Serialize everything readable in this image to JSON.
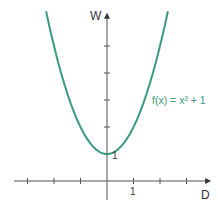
{
  "chart_data": {
    "type": "line",
    "title": "",
    "xlabel": "D",
    "ylabel": "W",
    "annotation": "f(x) = x² + 1",
    "vertex_label": "1",
    "x_tick_label": "1",
    "xlim": [
      -4,
      4
    ],
    "ylim": [
      -1,
      6.5
    ],
    "x_ticks": [
      -3,
      -2,
      -1,
      1,
      2,
      3
    ],
    "y_ticks": [
      1,
      2,
      3,
      4,
      5
    ],
    "grid": false,
    "series": [
      {
        "name": "f(x) = x² + 1",
        "color": "#3a9a80",
        "x": [
          -2.3,
          -2,
          -1.5,
          -1,
          -0.5,
          0,
          0.5,
          1,
          1.5,
          2,
          2.3
        ],
        "y": [
          6.29,
          5,
          3.25,
          2,
          1.25,
          1,
          1.25,
          2,
          3.25,
          5,
          6.29
        ]
      }
    ]
  },
  "labels": {
    "y_axis": "W",
    "x_axis": "D",
    "function": "f(x) = x² + 1",
    "vertex_value": "1",
    "x_unit": "1"
  },
  "colors": {
    "curve": "#3a9a80",
    "axis": "#555555"
  }
}
